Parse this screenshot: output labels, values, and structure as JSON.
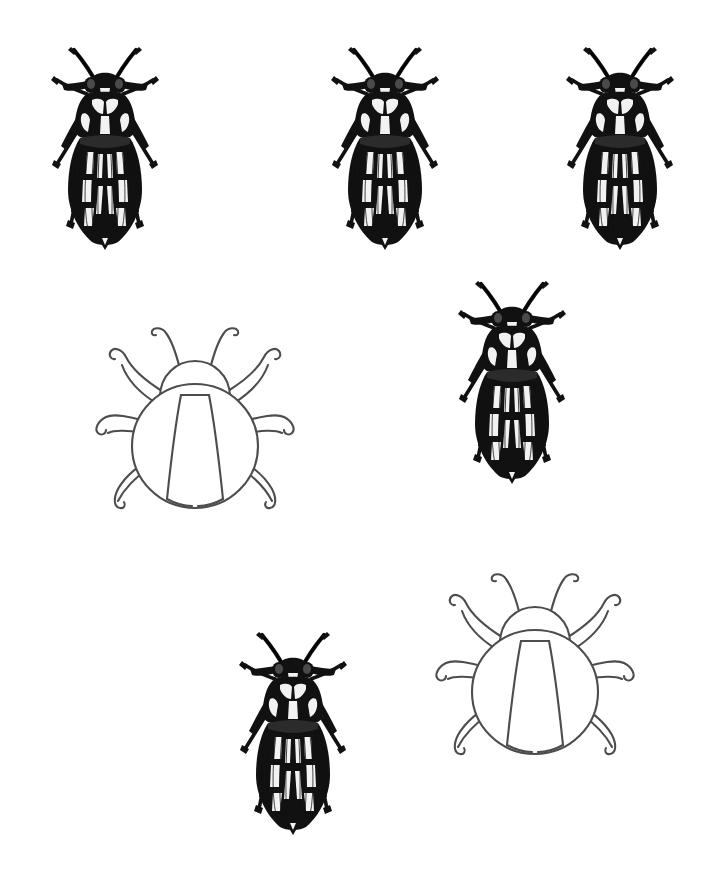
{
  "page": {
    "background_color": "#ffffff",
    "width": 702,
    "height": 877
  },
  "palette": {
    "engraving_dark": "#111111",
    "engraving_mid": "#2b2b2b",
    "engraving_soft": "#4a4a4a",
    "engraving_highlight": "#f2f2f2",
    "outline_stroke": "#4f4c4c",
    "paper": "#ffffff"
  },
  "figures": [
    {
      "id": "engraved-beetle-1",
      "style": "engraved",
      "label": "Engraved beetle specimen 1",
      "x": 30,
      "y": 28,
      "width": 150,
      "height": 225,
      "row": "top",
      "column": "left"
    },
    {
      "id": "engraved-beetle-2",
      "style": "engraved",
      "label": "Engraved beetle specimen 2",
      "x": 310,
      "y": 28,
      "width": 150,
      "height": 225,
      "row": "top",
      "column": "center"
    },
    {
      "id": "engraved-beetle-3",
      "style": "engraved",
      "label": "Engraved beetle specimen 3",
      "x": 545,
      "y": 28,
      "width": 150,
      "height": 225,
      "row": "top",
      "column": "right"
    },
    {
      "id": "outline-beetle-1",
      "style": "outline",
      "label": "Outline beetle drawing 1",
      "x": 84,
      "y": 303,
      "width": 222,
      "height": 222,
      "row": "middle",
      "column": "left"
    },
    {
      "id": "engraved-beetle-4",
      "style": "engraved",
      "label": "Engraved beetle specimen 4",
      "x": 437,
      "y": 262,
      "width": 150,
      "height": 225,
      "row": "middle",
      "column": "right"
    },
    {
      "id": "engraved-beetle-5",
      "style": "engraved",
      "label": "Engraved beetle specimen 5",
      "x": 218,
      "y": 613,
      "width": 150,
      "height": 225,
      "row": "bottom",
      "column": "center"
    },
    {
      "id": "outline-beetle-2",
      "style": "outline",
      "label": "Outline beetle drawing 2",
      "x": 424,
      "y": 549,
      "width": 222,
      "height": 222,
      "row": "bottom",
      "column": "right"
    }
  ],
  "counts": {
    "total_figures": 7,
    "engraved_beetles": 5,
    "outline_beetles": 2
  },
  "anatomy": {
    "engraved_parts": [
      "antennae",
      "compound-eyes",
      "pronotum",
      "elytra",
      "longitudinal-striae",
      "six-legs",
      "tarsi"
    ],
    "outline_parts": [
      "two-antennae",
      "head-dome",
      "body-oval",
      "elytra-seam",
      "six-curved-legs"
    ]
  }
}
